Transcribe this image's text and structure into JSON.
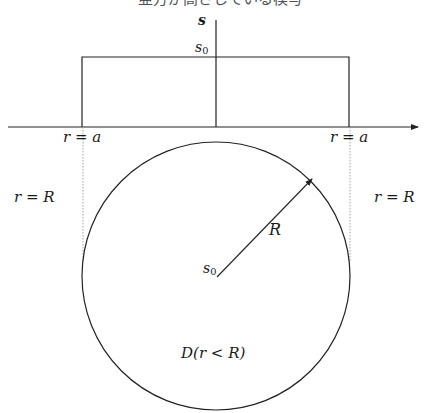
{
  "caption": "亜方が高さしている模写",
  "axes": {
    "vertical_label": "s",
    "horizontal_arrow": true
  },
  "rect": {
    "height_label_base": "s",
    "height_label_sub": "0",
    "left_label": "r = a",
    "right_label": "r = a"
  },
  "disk": {
    "left_label": "r = R",
    "right_label": "r = R",
    "radius_label": "R",
    "center_label_base": "s",
    "center_label_sub": "0",
    "region_label": "D(r < R)"
  },
  "colors": {
    "line": "#222222",
    "dotted": "#888888",
    "background": "#ffffff"
  }
}
